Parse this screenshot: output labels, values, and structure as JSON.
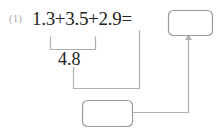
{
  "page": {
    "background_color": "#ffffff",
    "ink_color": "#222222",
    "muted_color": "#a9a9a9",
    "line_color": "#b0b0b0"
  },
  "problem": {
    "number_label": "(1)",
    "equation": "1.3+3.5+2.9=",
    "partial_sum": "4.8",
    "answer_box_value": "",
    "partial_box_value": ""
  },
  "annotations": {
    "grouping_bracket_name": "bracket-under-first-two-terms",
    "arrow_name": "arrow-to-answer-box"
  }
}
